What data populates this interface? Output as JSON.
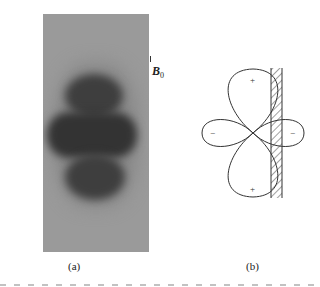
{
  "figure": {
    "panel_a": {
      "label": "(a)",
      "field_label": "B",
      "field_subscript": "0"
    },
    "panel_b": {
      "label": "(b)",
      "lobe_signs": {
        "top": "+",
        "bottom": "+",
        "left": "−",
        "right": "−"
      }
    },
    "caption": ""
  }
}
